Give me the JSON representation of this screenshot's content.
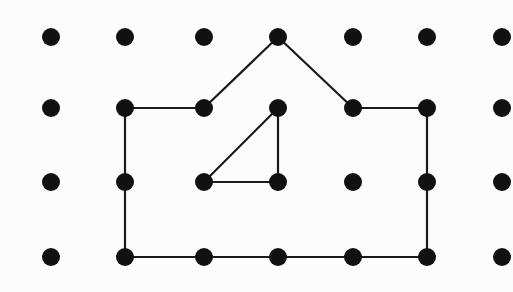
{
  "canvas": {
    "width": 513,
    "height": 292,
    "background_color": "#fcfcfc",
    "dot_color": "#111111",
    "line_color": "#1a1a1a",
    "dot_diameter": 18,
    "line_width": 2.2
  },
  "grid": {
    "columns": 7,
    "rows": 4,
    "column_x": [
      51,
      125,
      204,
      278,
      353,
      427,
      502
    ],
    "row_y": [
      37,
      108,
      182,
      257
    ],
    "column_spacing": 75,
    "row_spacing": 73,
    "dot_count": 28
  },
  "chart_data": {
    "type": "scatter",
    "title": "",
    "xlabel": "",
    "ylabel": "",
    "xlim": [
      0,
      513
    ],
    "ylim": [
      0,
      292
    ],
    "grid": false,
    "legend": "none",
    "points": [
      {
        "id": "r1c1",
        "row": 1,
        "col": 1,
        "x": 51,
        "y": 37,
        "connected": false
      },
      {
        "id": "r1c2",
        "row": 1,
        "col": 2,
        "x": 125,
        "y": 37,
        "connected": false
      },
      {
        "id": "r1c3",
        "row": 1,
        "col": 3,
        "x": 204,
        "y": 37,
        "connected": false
      },
      {
        "id": "r1c4",
        "row": 1,
        "col": 4,
        "x": 278,
        "y": 37,
        "connected": true
      },
      {
        "id": "r1c5",
        "row": 1,
        "col": 5,
        "x": 353,
        "y": 37,
        "connected": false
      },
      {
        "id": "r1c6",
        "row": 1,
        "col": 6,
        "x": 427,
        "y": 37,
        "connected": false
      },
      {
        "id": "r1c7",
        "row": 1,
        "col": 7,
        "x": 502,
        "y": 37,
        "connected": false
      },
      {
        "id": "r2c1",
        "row": 2,
        "col": 1,
        "x": 51,
        "y": 108,
        "connected": false
      },
      {
        "id": "r2c2",
        "row": 2,
        "col": 2,
        "x": 125,
        "y": 108,
        "connected": true
      },
      {
        "id": "r2c3",
        "row": 2,
        "col": 3,
        "x": 204,
        "y": 108,
        "connected": true
      },
      {
        "id": "r2c4",
        "row": 2,
        "col": 4,
        "x": 278,
        "y": 108,
        "connected": true
      },
      {
        "id": "r2c5",
        "row": 2,
        "col": 5,
        "x": 353,
        "y": 108,
        "connected": true
      },
      {
        "id": "r2c6",
        "row": 2,
        "col": 6,
        "x": 427,
        "y": 108,
        "connected": true
      },
      {
        "id": "r2c7",
        "row": 2,
        "col": 7,
        "x": 502,
        "y": 108,
        "connected": false
      },
      {
        "id": "r3c1",
        "row": 3,
        "col": 1,
        "x": 51,
        "y": 182,
        "connected": false
      },
      {
        "id": "r3c2",
        "row": 3,
        "col": 2,
        "x": 125,
        "y": 182,
        "connected": true
      },
      {
        "id": "r3c3",
        "row": 3,
        "col": 3,
        "x": 204,
        "y": 182,
        "connected": true
      },
      {
        "id": "r3c4",
        "row": 3,
        "col": 4,
        "x": 278,
        "y": 182,
        "connected": true
      },
      {
        "id": "r3c5",
        "row": 3,
        "col": 5,
        "x": 353,
        "y": 182,
        "connected": false
      },
      {
        "id": "r3c6",
        "row": 3,
        "col": 6,
        "x": 427,
        "y": 182,
        "connected": true
      },
      {
        "id": "r3c7",
        "row": 3,
        "col": 7,
        "x": 502,
        "y": 182,
        "connected": false
      },
      {
        "id": "r4c1",
        "row": 4,
        "col": 1,
        "x": 51,
        "y": 257,
        "connected": false
      },
      {
        "id": "r4c2",
        "row": 4,
        "col": 2,
        "x": 125,
        "y": 257,
        "connected": true
      },
      {
        "id": "r4c3",
        "row": 4,
        "col": 3,
        "x": 204,
        "y": 257,
        "connected": true
      },
      {
        "id": "r4c4",
        "row": 4,
        "col": 4,
        "x": 278,
        "y": 257,
        "connected": true
      },
      {
        "id": "r4c5",
        "row": 4,
        "col": 5,
        "x": 353,
        "y": 257,
        "connected": true
      },
      {
        "id": "r4c6",
        "row": 4,
        "col": 6,
        "x": 427,
        "y": 257,
        "connected": true
      },
      {
        "id": "r4c7",
        "row": 4,
        "col": 7,
        "x": 502,
        "y": 257,
        "connected": false
      }
    ],
    "edges": [
      {
        "name": "roof-left-slope",
        "from": "r1c4",
        "to": "r2c3",
        "x1": 278,
        "y1": 37,
        "x2": 204,
        "y2": 108
      },
      {
        "name": "roof-right-slope",
        "from": "r1c4",
        "to": "r2c5",
        "x1": 278,
        "y1": 37,
        "x2": 353,
        "y2": 108
      },
      {
        "name": "left-eave",
        "from": "r2c2",
        "to": "r2c3",
        "x1": 125,
        "y1": 108,
        "x2": 204,
        "y2": 108
      },
      {
        "name": "right-eave",
        "from": "r2c5",
        "to": "r2c6",
        "x1": 353,
        "y1": 108,
        "x2": 427,
        "y2": 108
      },
      {
        "name": "left-wall",
        "from": "r2c2",
        "to": "r4c2",
        "x1": 125,
        "y1": 108,
        "x2": 125,
        "y2": 257
      },
      {
        "name": "right-wall",
        "from": "r2c6",
        "to": "r4c6",
        "x1": 427,
        "y1": 108,
        "x2": 427,
        "y2": 257
      },
      {
        "name": "floor",
        "from": "r4c2",
        "to": "r4c6",
        "x1": 125,
        "y1": 257,
        "x2": 427,
        "y2": 257
      },
      {
        "name": "inner-triangle-hypotenuse",
        "from": "r2c4",
        "to": "r3c3",
        "x1": 278,
        "y1": 108,
        "x2": 204,
        "y2": 182
      },
      {
        "name": "inner-triangle-base",
        "from": "r3c3",
        "to": "r3c4",
        "x1": 204,
        "y1": 182,
        "x2": 278,
        "y2": 182
      },
      {
        "name": "inner-triangle-vertical",
        "from": "r2c4",
        "to": "r3c4",
        "x1": 278,
        "y1": 108,
        "x2": 278,
        "y2": 182
      }
    ],
    "edge_count": 10
  }
}
